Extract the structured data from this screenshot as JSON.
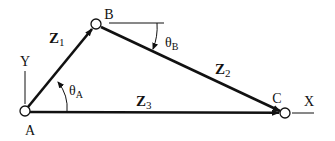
{
  "diagram": {
    "colors": {
      "stroke": "#111111",
      "background": "#ffffff"
    },
    "points": {
      "A": {
        "label": "A"
      },
      "B": {
        "label": "B"
      },
      "C": {
        "label": "C"
      }
    },
    "axes": {
      "x_label": "X",
      "y_label": "Y"
    },
    "vectors": [
      {
        "name": "Z",
        "sub": "1",
        "from": "A",
        "to": "B"
      },
      {
        "name": "Z",
        "sub": "2",
        "from": "B",
        "to": "C"
      },
      {
        "name": "Z",
        "sub": "3",
        "from": "A",
        "to": "C"
      }
    ],
    "angles": [
      {
        "symbol": "θ",
        "sub": "A"
      },
      {
        "symbol": "θ",
        "sub": "B"
      }
    ]
  }
}
